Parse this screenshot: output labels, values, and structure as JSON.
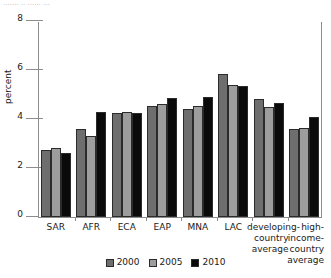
{
  "caption_sliver": "....... ..  ...... ...",
  "chart_data": {
    "type": "bar",
    "title": "",
    "xlabel": "",
    "ylabel": "percent",
    "ylim": [
      0,
      8
    ],
    "yticks": [
      0,
      2,
      4,
      6,
      8
    ],
    "ytick_labels": [
      "0",
      "2",
      "4",
      "6",
      "8"
    ],
    "grid": false,
    "legend_position": "bottom-center",
    "categories": [
      "SAR",
      "AFR",
      "ECA",
      "EAP",
      "MNA",
      "LAC",
      "developing-\ncountry\naverage",
      "high-\nincome-\ncountry\naverage"
    ],
    "series": [
      {
        "name": "2000",
        "color": "#6e6e6e",
        "values": [
          2.75,
          3.6,
          4.25,
          4.55,
          4.4,
          5.85,
          4.8,
          3.6
        ]
      },
      {
        "name": "2005",
        "color": "#9d9d9d",
        "values": [
          2.8,
          3.3,
          4.27,
          4.6,
          4.55,
          5.4,
          4.5,
          3.65
        ]
      },
      {
        "name": "2010",
        "color": "#0a0a0a",
        "values": [
          2.6,
          4.3,
          4.26,
          4.85,
          4.9,
          5.35,
          4.65,
          4.1
        ]
      }
    ]
  }
}
